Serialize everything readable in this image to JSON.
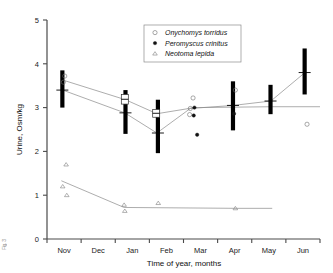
{
  "figure": {
    "left_margin_fragment": "Fig. 3"
  },
  "chart_data": {
    "type": "scatter",
    "title": "",
    "xlabel": "Time of year, months",
    "ylabel": "Urine, Osm/kg",
    "xlim": [
      0,
      8
    ],
    "ylim": [
      0,
      5
    ],
    "grid": false,
    "x_tick_labels": [
      "Nov",
      "Dec",
      "Jan",
      "Feb",
      "Mar",
      "Apr",
      "May",
      "Jun"
    ],
    "y_tick_labels": [
      "0",
      "1",
      "2",
      "3",
      "4",
      "5"
    ],
    "y_ticks": [
      0,
      1,
      2,
      3,
      4,
      5
    ],
    "legend_position": "top-center",
    "legend": [
      {
        "label": "Onychomys torridus",
        "marker": "open-circle"
      },
      {
        "label": "Peromyscus crinitus",
        "marker": "filled-circle"
      },
      {
        "label": "Neotoma lepida",
        "marker": "open-triangle"
      }
    ],
    "range_bars": [
      {
        "month": "Nov",
        "x": 0.45,
        "low": 3.0,
        "high": 3.85,
        "mean": 3.4
      },
      {
        "month": "Jan",
        "x": 2.3,
        "low": 2.4,
        "high": 3.4,
        "mean": 2.88
      },
      {
        "month": "Feb",
        "x": 3.25,
        "low": 1.96,
        "high": 3.18,
        "mean": 2.42
      },
      {
        "month": "Apr",
        "x": 5.45,
        "low": 2.48,
        "high": 3.6,
        "mean": 3.05
      },
      {
        "month": "May",
        "x": 6.55,
        "low": 2.85,
        "high": 3.52,
        "mean": 3.15
      },
      {
        "month": "Jun",
        "x": 7.55,
        "low": 3.3,
        "high": 4.35,
        "mean": 3.8
      }
    ],
    "open_boxes": [
      {
        "month": "Jan",
        "x": 2.28,
        "low": 3.08,
        "high": 3.3,
        "mean": 3.19
      },
      {
        "month": "Feb",
        "x": 3.2,
        "low": 2.78,
        "high": 2.96,
        "mean": 2.87
      }
    ],
    "series": [
      {
        "name": "Onychomys torridus",
        "marker": "open-circle",
        "points": [
          {
            "x": 0.52,
            "y": 3.72
          },
          {
            "x": 0.48,
            "y": 3.58
          },
          {
            "x": 4.28,
            "y": 3.22
          },
          {
            "x": 4.2,
            "y": 2.98
          },
          {
            "x": 4.18,
            "y": 2.84
          },
          {
            "x": 5.52,
            "y": 3.4
          },
          {
            "x": 7.62,
            "y": 2.62
          }
        ],
        "trend": [
          {
            "x": 0.46,
            "y": 3.4
          },
          {
            "x": 2.28,
            "y": 2.88
          },
          {
            "x": 3.22,
            "y": 2.42
          },
          {
            "x": 4.2,
            "y": 2.98
          },
          {
            "x": 5.46,
            "y": 3.05
          },
          {
            "x": 6.56,
            "y": 3.15
          },
          {
            "x": 7.56,
            "y": 3.8
          }
        ]
      },
      {
        "name": "Peromyscus crinitus",
        "marker": "filled-circle",
        "points": [
          {
            "x": 4.32,
            "y": 3.0
          },
          {
            "x": 4.3,
            "y": 2.82
          },
          {
            "x": 4.4,
            "y": 2.38
          },
          {
            "x": 5.48,
            "y": 2.86
          }
        ],
        "trend": [
          {
            "x": 0.5,
            "y": 3.62
          },
          {
            "x": 2.3,
            "y": 3.18
          },
          {
            "x": 3.22,
            "y": 2.86
          },
          {
            "x": 4.32,
            "y": 3.0
          },
          {
            "x": 6.6,
            "y": 3.02
          },
          {
            "x": 8.0,
            "y": 3.02
          }
        ]
      },
      {
        "name": "Neotoma lepida",
        "marker": "open-triangle",
        "points": [
          {
            "x": 0.56,
            "y": 1.7
          },
          {
            "x": 0.46,
            "y": 1.2
          },
          {
            "x": 0.58,
            "y": 1.0
          },
          {
            "x": 2.26,
            "y": 0.78
          },
          {
            "x": 2.28,
            "y": 0.64
          },
          {
            "x": 3.26,
            "y": 0.82
          },
          {
            "x": 5.52,
            "y": 0.7
          }
        ],
        "trend": [
          {
            "x": 0.42,
            "y": 1.33
          },
          {
            "x": 2.26,
            "y": 0.72
          },
          {
            "x": 5.56,
            "y": 0.7
          },
          {
            "x": 6.6,
            "y": 0.7
          }
        ]
      }
    ]
  }
}
